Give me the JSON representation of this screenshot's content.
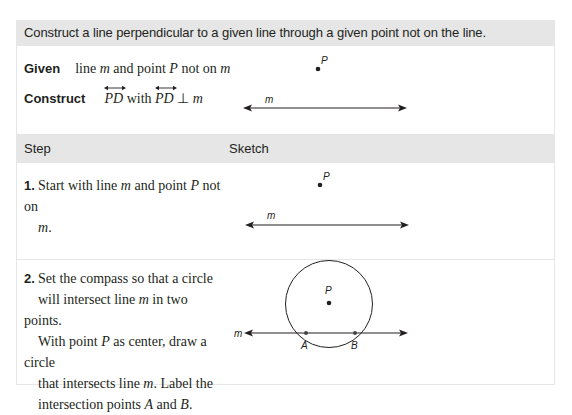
{
  "document": {
    "title": "Construct a line perpendicular to a given line through a given point not on the line.",
    "given": {
      "label": "Given",
      "text_parts": [
        "line ",
        "m",
        " and point ",
        "P",
        " not on ",
        "m"
      ]
    },
    "construct": {
      "label": "Construct",
      "ray1": "PD",
      "with": " with ",
      "ray2": "PD",
      "perp": " ⊥ ",
      "line": "m"
    },
    "given_sketch": {
      "point_label": "P",
      "line_label": "m"
    },
    "table_headers": {
      "step": "Step",
      "sketch": "Sketch"
    },
    "steps": [
      {
        "number": "1.",
        "text_parts": [
          "Start with line ",
          "m",
          " and point ",
          "P",
          " not on ",
          "m",
          "."
        ],
        "sketch": {
          "point_label": "P",
          "line_label": "m"
        }
      },
      {
        "number": "2.",
        "lines": [
          [
            "Set the compass so that a circle"
          ],
          [
            "will intersect line ",
            "m",
            " in two points."
          ],
          [
            "With point ",
            "P",
            " as center, draw a circle"
          ],
          [
            "that intersects line ",
            "m",
            ". Label the"
          ],
          [
            "intersection points ",
            "A",
            " and ",
            "B",
            "."
          ]
        ],
        "sketch": {
          "center_label": "P",
          "line_label": "m",
          "intersection_labels": [
            "A",
            "B"
          ]
        }
      }
    ]
  },
  "colors": {
    "header_bg": "#e6e6e6",
    "border": "#e6e6e6",
    "text": "#231f20"
  }
}
